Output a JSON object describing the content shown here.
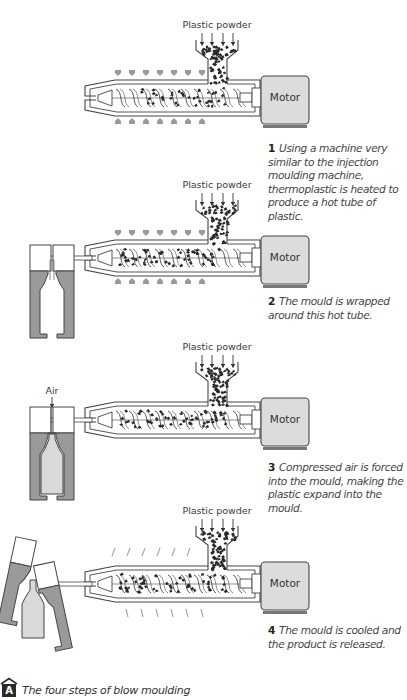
{
  "figure": {
    "badge": "A",
    "title": "The four steps of blow moulding"
  },
  "colors": {
    "mould_grey": "#9a9a9a",
    "bottle_fill": "#d9d9d9",
    "motor_fill": "#dcdcdc",
    "heater_arrow": "#9a9a9a",
    "pellet": "#2a2a2a",
    "outline": "#444444"
  },
  "steps": [
    {
      "number": "1",
      "input_label": "Plastic powder",
      "motor_label": "Motor",
      "caption": "Using a machine very similar to the injection moulding machine, thermoplastic is heated to produce a hot tube of plastic.",
      "mould_state": "none",
      "heat_indicator": "heating",
      "offset_y": 0
    },
    {
      "number": "2",
      "input_label": "Plastic powder",
      "motor_label": "Motor",
      "caption": "The mould is wrapped around this hot tube.",
      "mould_state": "closed",
      "heat_indicator": "heating",
      "offset_y": 160
    },
    {
      "number": "3",
      "input_label": "Plastic powder",
      "motor_label": "Motor",
      "air_label": "Air",
      "caption": "Compressed air is forced into the mould, making the plastic expand into the mould.",
      "mould_state": "blown",
      "heat_indicator": "none",
      "offset_y": 322
    },
    {
      "number": "4",
      "input_label": "Plastic powder",
      "motor_label": "Motor",
      "caption": "The mould is cooled and the product is released.",
      "mould_state": "open",
      "heat_indicator": "cooling",
      "offset_y": 486
    }
  ]
}
